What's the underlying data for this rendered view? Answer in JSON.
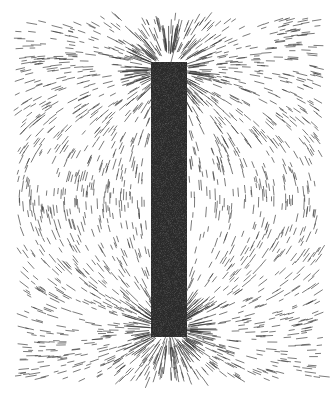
{
  "image": {
    "subject": "Iron filings aligned along the magnetic field lines of a bar magnet",
    "caption": "Bar magnet with iron filings",
    "width": 336,
    "height": 399,
    "colors": {
      "background": "#ffffff",
      "magnet": "#2a2a2a",
      "filings": "#3a3a3a"
    },
    "magnet": {
      "x": 151,
      "y": 62,
      "width": 36,
      "height": 275
    },
    "filings_area": {
      "x": 14,
      "y": 14,
      "width": 311,
      "height": 370
    }
  }
}
